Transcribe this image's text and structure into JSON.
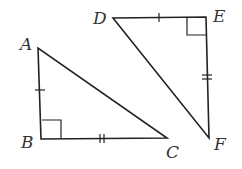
{
  "figure": {
    "triangles": [
      {
        "name": "ABC",
        "right_angle_at": "B",
        "vertices": {
          "A": [
            38,
            48
          ],
          "B": [
            41,
            139
          ],
          "C": [
            167,
            138
          ]
        },
        "single_tick_side": "AB",
        "double_tick_side": "BC"
      },
      {
        "name": "DEF",
        "right_angle_at": "E",
        "vertices": {
          "D": [
            113,
            18
          ],
          "E": [
            206,
            17
          ],
          "F": [
            209,
            138
          ]
        },
        "single_tick_side": "DE",
        "double_tick_side": "EF"
      }
    ],
    "labels": {
      "A": "A",
      "B": "B",
      "C": "C",
      "D": "D",
      "E": "E",
      "F": "F"
    },
    "stroke_color": "#222222"
  }
}
